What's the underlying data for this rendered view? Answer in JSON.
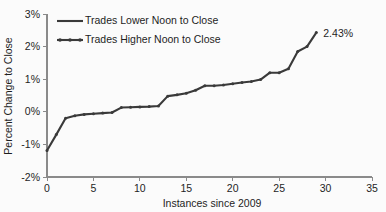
{
  "chart_data": {
    "type": "line",
    "title": "",
    "xlabel": "Instances since 2009",
    "ylabel": "Percent Change to Close",
    "xlim": [
      0,
      35
    ],
    "ylim": [
      -2,
      3
    ],
    "xticks": [
      "0",
      "5",
      "10",
      "15",
      "20",
      "25",
      "30",
      "35"
    ],
    "xtick_values": [
      0,
      5,
      10,
      15,
      20,
      25,
      30,
      35
    ],
    "yticks": [
      "-2%",
      "-1%",
      "0%",
      "1%",
      "2%",
      "3%"
    ],
    "ytick_values": [
      -2,
      -1,
      0,
      1,
      2,
      3
    ],
    "grid": false,
    "legend_position": "upper-left",
    "series": [
      {
        "name": "Trades Lower Noon to Close",
        "marker": "none",
        "color": "#3a3a3a",
        "x": [],
        "values": []
      },
      {
        "name": "Trades Higher Noon to Close",
        "marker": "dot",
        "color": "#3a3a3a",
        "x": [
          0,
          1,
          2,
          3,
          4,
          5,
          6,
          7,
          8,
          9,
          10,
          11,
          12,
          13,
          14,
          15,
          16,
          17,
          18,
          19,
          20,
          21,
          22,
          23,
          24,
          25,
          26,
          27,
          28,
          29
        ],
        "values": [
          -1.19,
          -0.7,
          -0.2,
          -0.12,
          -0.08,
          -0.06,
          -0.04,
          -0.02,
          0.13,
          0.14,
          0.15,
          0.16,
          0.18,
          0.48,
          0.52,
          0.57,
          0.66,
          0.8,
          0.8,
          0.82,
          0.86,
          0.9,
          0.93,
          0.99,
          1.2,
          1.2,
          1.32,
          1.85,
          2.0,
          2.43
        ]
      }
    ],
    "annotations": [
      {
        "text": "2.43%",
        "x": 29,
        "y": 2.43
      }
    ]
  },
  "legend": {
    "items": [
      {
        "label": "Trades Lower Noon to Close"
      },
      {
        "label": "Trades Higher Noon to Close"
      }
    ]
  }
}
